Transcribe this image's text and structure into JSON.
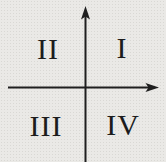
{
  "figure": {
    "background_color": "#eae9e6",
    "axis_color": "#1f1f1f",
    "label_color": "#1c1c1c",
    "axes": {
      "x_axis": {
        "arrow_end": "right"
      },
      "y_axis": {
        "arrow_end": "up"
      }
    },
    "quadrants": {
      "q1": {
        "numeral": "I",
        "position": "top-right"
      },
      "q2": {
        "numeral": "II",
        "position": "top-left"
      },
      "q3": {
        "numeral": "III",
        "position": "bottom-left"
      },
      "q4": {
        "numeral": "IV",
        "position": "bottom-right"
      }
    }
  }
}
